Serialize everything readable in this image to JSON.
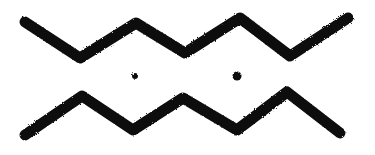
{
  "symbol": {
    "name": "Two zigzag lines with two dots",
    "ink_color": "#111111",
    "background_color": "#ffffff",
    "stroke_width": 11,
    "top_zigzag": [
      [
        25,
        22
      ],
      [
        80,
        58
      ],
      [
        136,
        23
      ],
      [
        185,
        53
      ],
      [
        240,
        18
      ],
      [
        290,
        56
      ],
      [
        348,
        18
      ]
    ],
    "bottom_zigzag": [
      [
        25,
        135
      ],
      [
        82,
        96
      ],
      [
        133,
        130
      ],
      [
        183,
        98
      ],
      [
        237,
        130
      ],
      [
        287,
        92
      ],
      [
        340,
        133
      ]
    ],
    "dots": [
      {
        "cx": 135,
        "cy": 76,
        "r": 3
      },
      {
        "cx": 237,
        "cy": 76,
        "r": 4.5
      }
    ]
  }
}
